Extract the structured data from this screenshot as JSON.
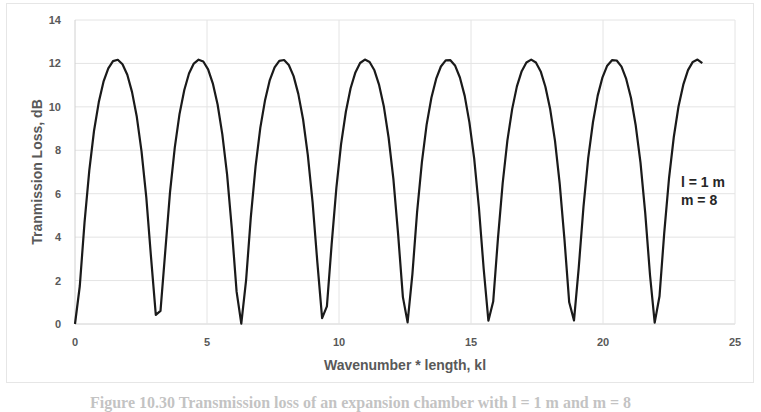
{
  "chart_data": {
    "type": "line",
    "title": "",
    "xlabel": "Wavenumber * length, kl",
    "ylabel": "Tranmission Loss, dB",
    "xlim": [
      0,
      25
    ],
    "ylim": [
      0,
      14
    ],
    "xticks": [
      0,
      5,
      10,
      15,
      20,
      25
    ],
    "yticks": [
      0,
      2,
      4,
      6,
      8,
      10,
      12,
      14
    ],
    "grid": true,
    "legend": null,
    "annotations": [
      "l = 1 m",
      "m = 8"
    ],
    "series": [
      {
        "name": "Transmission Loss",
        "color": "#1a1a1a",
        "formula": "TL = 10*log10(1 + 0.25*(m - 1/m)^2 * sin^2(kl)), m = 8",
        "x_range": [
          0,
          23.8
        ],
        "peak_value": 12.1,
        "peaks_at_kl": [
          1.57,
          4.71,
          7.85,
          11.0,
          14.14,
          17.28,
          20.42,
          23.56
        ],
        "minima_at_kl": [
          0,
          3.14,
          6.28,
          9.42,
          12.57,
          15.71,
          18.85,
          21.99
        ],
        "x": [
          0,
          0.5,
          1.0,
          1.57,
          2.0,
          2.5,
          3.14,
          3.8,
          4.3,
          4.71,
          5.2,
          5.8,
          6.28,
          6.9,
          7.4,
          7.85,
          8.4,
          9.0,
          9.42,
          10.0,
          10.5,
          11.0,
          11.5,
          12.1,
          12.57,
          13.2,
          13.7,
          14.14,
          14.6,
          15.2,
          15.71,
          16.3,
          16.8,
          17.28,
          17.8,
          18.4,
          18.85,
          19.5,
          20.0,
          20.42,
          20.9,
          21.5,
          21.99,
          22.6,
          23.1,
          23.56,
          23.8
        ],
        "y": [
          0,
          9.6,
          11.7,
          12.1,
          11.8,
          9.6,
          0,
          10.1,
          11.9,
          12.1,
          11.8,
          7.4,
          0,
          10.1,
          11.9,
          12.1,
          11.6,
          7.0,
          0.4,
          9.7,
          11.7,
          12.1,
          11.8,
          8.7,
          0.4,
          9.6,
          11.7,
          12.1,
          11.8,
          9.6,
          0,
          9.6,
          11.7,
          12.1,
          11.8,
          9.6,
          0,
          10.5,
          11.9,
          12.1,
          11.8,
          9.6,
          0,
          10.1,
          11.9,
          12.1,
          11.9
        ]
      }
    ]
  },
  "plot": {
    "xlabel": "Wavenumber * length, kl",
    "ylabel": "Tranmission Loss, dB",
    "annotation_line1": "l = 1 m",
    "annotation_line2": "m = 8",
    "xtick_labels": [
      "0",
      "5",
      "10",
      "15",
      "20",
      "25"
    ],
    "ytick_labels": [
      "0",
      "2",
      "4",
      "6",
      "8",
      "10",
      "12",
      "14"
    ]
  },
  "caption": "Figure 10.30 Transmission loss of an expansion chamber with l = 1 m and m = 8"
}
